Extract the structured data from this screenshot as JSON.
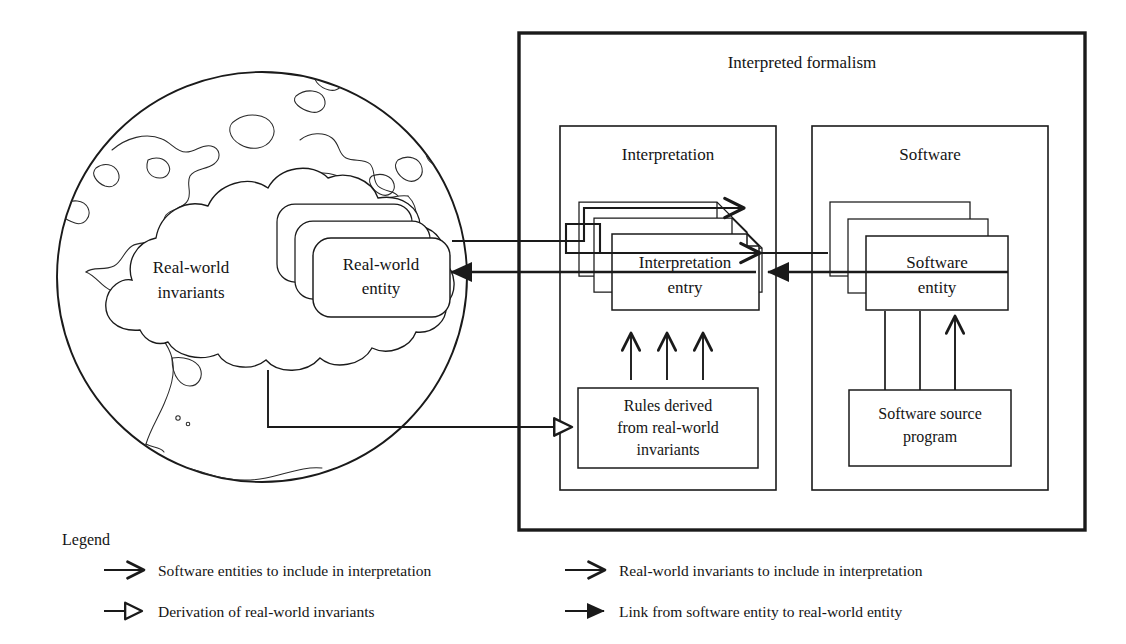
{
  "figure": {
    "type": "conceptual-diagram",
    "title_visible": false
  },
  "outer_frame": {
    "label": "Interpreted formalism"
  },
  "panels": [
    {
      "key": "interpretation",
      "label": "Interpretation"
    },
    {
      "key": "software",
      "label": "Software"
    }
  ],
  "globe": {
    "cloud_label_line1": "Real-world",
    "cloud_label_line2": "invariants",
    "entity_label_line1": "Real-world",
    "entity_label_line2": "entity"
  },
  "nodes": {
    "interpretation_entry_line1": "Interpretation",
    "interpretation_entry_line2": "entry",
    "software_entity_line1": "Software",
    "software_entity_line2": "entity",
    "rules_line1": "Rules derived",
    "rules_line2": "from real-world",
    "rules_line3": "invariants",
    "source_line1": "Software source",
    "source_line2": "program"
  },
  "legend": {
    "title": "Legend",
    "items": [
      {
        "id": "sw-entities-include",
        "arrow": "open-v-arrow",
        "text": "Software entities to include in interpretation",
        "column": "left",
        "row": 1
      },
      {
        "id": "derivation",
        "arrow": "hollow-triangle-arrow",
        "text": "Derivation of real-world invariants",
        "column": "left",
        "row": 2
      },
      {
        "id": "rw-invariants-include",
        "arrow": "open-v-arrow",
        "text": "Real-world invariants to include in interpretation",
        "column": "right",
        "row": 1
      },
      {
        "id": "link-sw-to-rw",
        "arrow": "solid-triangle-arrow",
        "text": "Link from software entity to real-world entity",
        "column": "right",
        "row": 2
      }
    ]
  },
  "colors": {
    "ink": "#1a1a1a",
    "paper": "#ffffff",
    "coastline": "#2a2a2a"
  }
}
